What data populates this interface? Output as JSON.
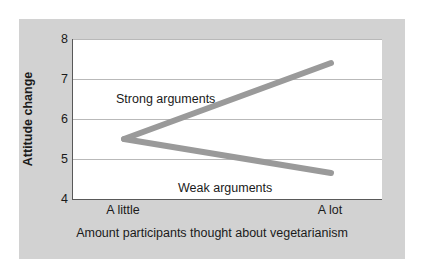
{
  "chart_data": {
    "type": "line",
    "title": "",
    "xlabel": "Amount participants thought about vegetarianism",
    "ylabel": "Attitude change",
    "x": [
      "A little",
      "A lot"
    ],
    "xticklabels": [
      "A little",
      "A lot"
    ],
    "yticklabels": [
      "4",
      "5",
      "6",
      "7",
      "8"
    ],
    "yticks": [
      4,
      5,
      6,
      7,
      8
    ],
    "ylim": [
      4,
      8
    ],
    "grid": true,
    "grid_axis": "y",
    "legend_position": "inline-annotations",
    "series": [
      {
        "name": "Strong arguments",
        "values": [
          5.5,
          7.4
        ],
        "color": "#9a9a9a",
        "annotation": "Strong arguments"
      },
      {
        "name": "Weak arguments",
        "values": [
          5.5,
          4.65
        ],
        "color": "#9a9a9a",
        "annotation": "Weak arguments"
      }
    ]
  },
  "figure": {
    "panel_color": "#d2d2d2",
    "plot_background": "#ffffff",
    "axis_color": "#595959",
    "gridline_color": "#b9b9b9",
    "line_color": "#9a9a9a",
    "text_color": "#1a1a1a"
  },
  "axes": {
    "y_title": "Attitude change",
    "x_title": "Amount participants thought about vegetarianism",
    "y_ticks": [
      {
        "label": "8",
        "value": 8
      },
      {
        "label": "7",
        "value": 7
      },
      {
        "label": "6",
        "value": 6
      },
      {
        "label": "5",
        "value": 5
      },
      {
        "label": "4",
        "value": 4
      }
    ],
    "x_ticks": [
      {
        "label": "A little",
        "value": 0
      },
      {
        "label": "A lot",
        "value": 1
      }
    ]
  },
  "annotations": [
    {
      "text": "Strong arguments",
      "series": "Strong arguments"
    },
    {
      "text": "Weak arguments",
      "series": "Weak arguments"
    }
  ]
}
